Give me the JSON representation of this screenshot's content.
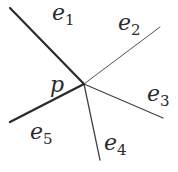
{
  "diagram": {
    "vertex": {
      "label": "p",
      "x": 84,
      "y": 84
    },
    "edges": [
      {
        "name": "e",
        "sub": "1",
        "x1": 10,
        "y1": 8,
        "width": 2.2,
        "color": "#2b2b2b",
        "lx": 52,
        "ly": 18,
        "ls": "1"
      },
      {
        "name": "e",
        "sub": "2",
        "x1": 160,
        "y1": 27,
        "width": 1.0,
        "color": "#555555",
        "lx": 118,
        "ly": 28,
        "ls": "2"
      },
      {
        "name": "e",
        "sub": "3",
        "x1": 163,
        "y1": 118,
        "width": 1.3,
        "color": "#444444",
        "lx": 146,
        "ly": 101,
        "ls": "3"
      },
      {
        "name": "e",
        "sub": "4",
        "x1": 100,
        "y1": 160,
        "width": 1.3,
        "color": "#444444",
        "lx": 104,
        "ly": 151,
        "ls": "4"
      },
      {
        "name": "e",
        "sub": "5",
        "x1": 10,
        "y1": 122,
        "width": 2.4,
        "color": "#2b2b2b",
        "lx": 30,
        "ly": 139,
        "ls": "5"
      }
    ],
    "labels": {
      "p": "p",
      "e1": "e",
      "e1_sub": "1",
      "e2": "e",
      "e2_sub": "2",
      "e3": "e",
      "e3_sub": "3",
      "e4": "e",
      "e4_sub": "4",
      "e5": "e",
      "e5_sub": "5"
    }
  }
}
